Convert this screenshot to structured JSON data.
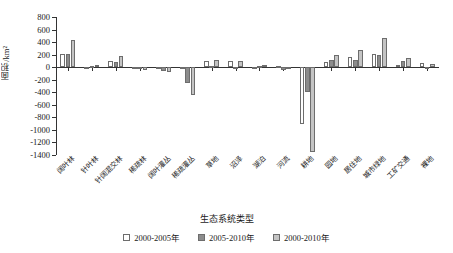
{
  "chart_data": {
    "type": "bar",
    "title": "",
    "xlabel": "生态系统类型",
    "ylabel": "面积/km²",
    "ylim": [
      -1400,
      800
    ],
    "yticks": [
      800,
      600,
      400,
      200,
      0,
      -200,
      -400,
      -600,
      -800,
      -1000,
      -1200,
      -1400
    ],
    "ytick_labels": [
      "800",
      "600",
      "400",
      "200",
      "0",
      "-200",
      "-400",
      "-600",
      "-800",
      "-1000",
      "-1200",
      "-1400"
    ],
    "grid": false,
    "legend_position": "bottom",
    "categories": [
      "阔叶林",
      "针叶林",
      "针阔混交林",
      "稀疏林",
      "阔叶灌丛",
      "稀疏灌丛",
      "草地",
      "沼泽",
      "湖泊",
      "河流",
      "耕地",
      "园地",
      "居住地",
      "城市绿地",
      "工矿交通",
      "裸地"
    ],
    "series": [
      {
        "name": "2000-2005年",
        "color": "#ffffff",
        "values": [
          215,
          10,
          100,
          5,
          -10,
          -30,
          100,
          95,
          10,
          20,
          -900,
          75,
          160,
          210,
          40,
          60
        ]
      },
      {
        "name": "2005-2010年",
        "color": "#8c8c8c",
        "values": [
          215,
          25,
          85,
          -5,
          -60,
          -250,
          15,
          10,
          15,
          -40,
          -400,
          120,
          110,
          200,
          105,
          -10
        ]
      },
      {
        "name": "2000-2010年",
        "color": "#c4c4c4",
        "values": [
          430,
          30,
          180,
          -40,
          -75,
          -440,
          120,
          105,
          30,
          -20,
          -1350,
          190,
          280,
          470,
          150,
          45
        ]
      }
    ]
  },
  "legend": {
    "items": [
      {
        "label": "2000-2005年",
        "swatch": "s0"
      },
      {
        "label": "2005-2010年",
        "swatch": "s1"
      },
      {
        "label": "2000-2010年",
        "swatch": "s2"
      }
    ]
  }
}
